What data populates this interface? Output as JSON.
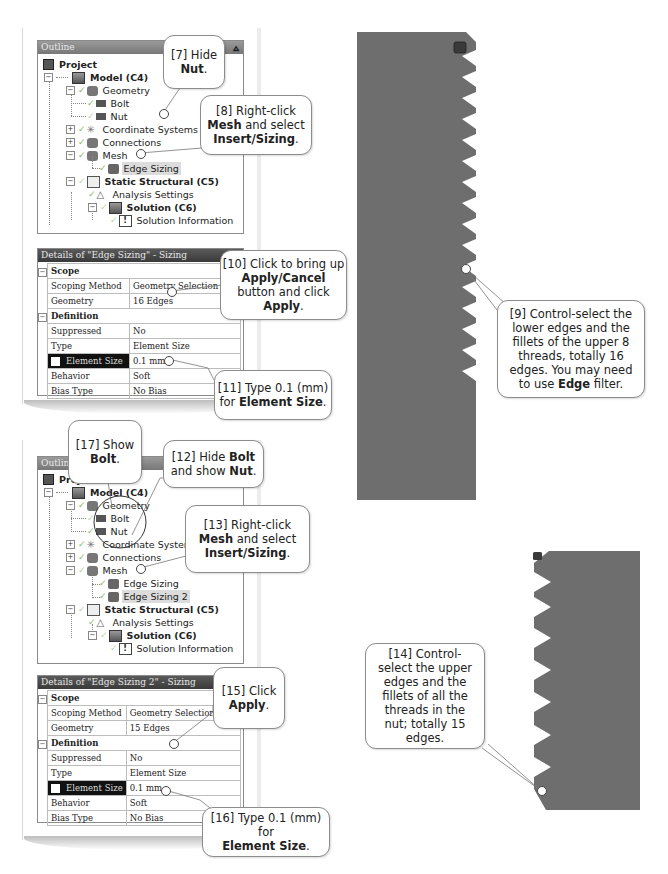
{
  "panel1": {
    "outline": {
      "title": "Outline",
      "pin_icon": "pin-icon",
      "tree": [
        {
          "label": "Project",
          "bold": true,
          "icon": "project-icon"
        },
        {
          "label": "Model (C4)",
          "bold": true,
          "icon": "model-icon"
        },
        {
          "label": "Geometry",
          "icon": "geometry-icon"
        },
        {
          "label": "Bolt",
          "icon": "body-icon"
        },
        {
          "label": "Nut",
          "icon": "body-icon"
        },
        {
          "label": "Coordinate Systems",
          "icon": "coordinate-systems-icon"
        },
        {
          "label": "Connections",
          "icon": "connections-icon"
        },
        {
          "label": "Mesh",
          "icon": "mesh-icon"
        },
        {
          "label": "Edge Sizing",
          "icon": "sizing-icon",
          "selected": true
        },
        {
          "label": "Static Structural (C5)",
          "bold": true,
          "icon": "static-structural-icon"
        },
        {
          "label": "Analysis Settings",
          "icon": "analysis-settings-icon"
        },
        {
          "label": "Solution (C6)",
          "bold": true,
          "icon": "solution-icon"
        },
        {
          "label": "Solution Information",
          "icon": "solution-information-icon"
        }
      ]
    },
    "details": {
      "title": "Details of \"Edge Sizing\" - Sizing",
      "sections": [
        {
          "name": "Scope",
          "rows": [
            {
              "label": "Scoping Method",
              "value": "Geometry Selection"
            },
            {
              "label": "Geometry",
              "value": "16 Edges"
            }
          ]
        },
        {
          "name": "Definition",
          "rows": [
            {
              "label": "Suppressed",
              "value": "No"
            },
            {
              "label": "Type",
              "value": "Element Size"
            },
            {
              "label": "Element Size",
              "value": "0.1 mm",
              "highlight": true
            },
            {
              "label": "Behavior",
              "value": "Soft"
            },
            {
              "label": "Bias Type",
              "value": "No Bias"
            }
          ]
        }
      ]
    }
  },
  "panel2": {
    "outline": {
      "title": "Outline",
      "tree": [
        {
          "label": "Project",
          "bold": true
        },
        {
          "label": "Model (C4)",
          "bold": true
        },
        {
          "label": "Geometry"
        },
        {
          "label": "Bolt"
        },
        {
          "label": "Nut"
        },
        {
          "label": "Coordinate Systems"
        },
        {
          "label": "Connections"
        },
        {
          "label": "Mesh"
        },
        {
          "label": "Edge Sizing"
        },
        {
          "label": "Edge Sizing 2",
          "selected": true
        },
        {
          "label": "Static Structural (C5)",
          "bold": true
        },
        {
          "label": "Analysis Settings"
        },
        {
          "label": "Solution (C6)",
          "bold": true
        },
        {
          "label": "Solution Information"
        }
      ]
    },
    "details": {
      "title": "Details of \"Edge Sizing 2\" - Sizing",
      "sections": [
        {
          "name": "Scope",
          "rows": [
            {
              "label": "Scoping Method",
              "value": "Geometry Selection"
            },
            {
              "label": "Geometry",
              "value": "15 Edges"
            }
          ]
        },
        {
          "name": "Definition",
          "rows": [
            {
              "label": "Suppressed",
              "value": "No"
            },
            {
              "label": "Type",
              "value": "Element Size"
            },
            {
              "label": "Element Size",
              "value": "0.1 mm",
              "highlight": true
            },
            {
              "label": "Behavior",
              "value": "Soft"
            },
            {
              "label": "Bias Type",
              "value": "No Bias"
            }
          ]
        }
      ]
    }
  },
  "callouts": {
    "c7": {
      "step": "[7]",
      "pre": "Hide",
      "bold": "Nut",
      "post": "."
    },
    "c8": {
      "step": "[8]",
      "line1": "Right-click",
      "bold1": "Mesh",
      "mid": "and select",
      "bold2": "Insert/Sizing",
      "post": "."
    },
    "c9": {
      "step": "[9]",
      "text1": "Control-select the lower edges and the fillets of the upper 8 threads, totally 16 edges. You may need to use",
      "bold": "Edge",
      "post": "filter."
    },
    "c10": {
      "step": "[10]",
      "line1": "Click to bring up",
      "bold1": "Apply/Cancel",
      "mid": "button and click",
      "bold2": "Apply",
      "post": "."
    },
    "c11": {
      "step": "[11]",
      "line1": "Type 0.1 (mm)",
      "pre2": "for",
      "bold": "Element Size",
      "post": "."
    },
    "c12": {
      "step": "[12]",
      "pre": "Hide",
      "bold1": "Bolt",
      "mid": "and show",
      "bold2": "Nut",
      "post": "."
    },
    "c13": {
      "step": "[13]",
      "line1": "Right-click",
      "bold1": "Mesh",
      "mid": "and select",
      "bold2": "Insert/Sizing",
      "post": "."
    },
    "c14": {
      "step": "[14]",
      "text": "Control-select the upper edges and the fillets of all the threads in the nut; totally 15 edges."
    },
    "c15": {
      "step": "[15]",
      "pre": "Click",
      "bold": "Apply",
      "post": "."
    },
    "c16": {
      "step": "[16]",
      "line1": "Type 0.1 (mm) for",
      "bold": "Element Size",
      "post": "."
    },
    "c17": {
      "step": "[17]",
      "pre": "Show",
      "bold": "Bolt",
      "post": "."
    }
  },
  "graphics": {
    "bolt": {
      "label": "bolt-thread-section",
      "color": "#6e6e6e",
      "threads": 12
    },
    "nut": {
      "label": "nut-thread-section",
      "color": "#6e6e6e",
      "threads": 8
    },
    "triad_marker_color": "#3a3a3a"
  }
}
